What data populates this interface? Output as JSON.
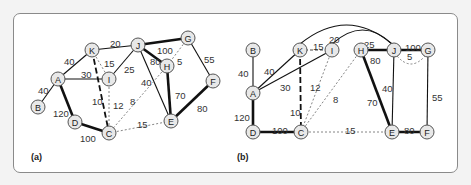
{
  "panels": {
    "a": {
      "label": "(a)",
      "nodes": [
        {
          "id": "K",
          "x": 92,
          "y": 50
        },
        {
          "id": "J",
          "x": 138,
          "y": 45
        },
        {
          "id": "G",
          "x": 188,
          "y": 38
        },
        {
          "id": "A",
          "x": 58,
          "y": 79
        },
        {
          "id": "I",
          "x": 109,
          "y": 79
        },
        {
          "id": "H",
          "x": 167,
          "y": 66
        },
        {
          "id": "F",
          "x": 213,
          "y": 81
        },
        {
          "id": "B",
          "x": 38,
          "y": 107
        },
        {
          "id": "D",
          "x": 75,
          "y": 122
        },
        {
          "id": "C",
          "x": 109,
          "y": 133
        },
        {
          "id": "E",
          "x": 171,
          "y": 121
        }
      ],
      "edges": [
        {
          "from": "A",
          "to": "B",
          "weight": "40",
          "style": "solid",
          "lx": 38,
          "ly": 91
        },
        {
          "from": "A",
          "to": "K",
          "weight": "40",
          "style": "solid",
          "lx": 64,
          "ly": 62
        },
        {
          "from": "A",
          "to": "I",
          "weight": "30",
          "style": "solid",
          "lx": 81,
          "ly": 75
        },
        {
          "from": "A",
          "to": "D",
          "weight": "120",
          "style": "bold",
          "lx": 53,
          "ly": 114
        },
        {
          "from": "K",
          "to": "J",
          "weight": "20",
          "style": "solid",
          "lx": 110,
          "ly": 44
        },
        {
          "from": "K",
          "to": "I",
          "weight": "15",
          "style": "dotted",
          "lx": 104,
          "ly": 64
        },
        {
          "from": "K",
          "to": "C",
          "weight": "10",
          "style": "dashed-bold",
          "lx": 92,
          "ly": 102
        },
        {
          "from": "I",
          "to": "J",
          "weight": "25",
          "style": "solid",
          "lx": 124,
          "ly": 70
        },
        {
          "from": "I",
          "to": "C",
          "weight": "12",
          "style": "dotted",
          "lx": 113,
          "ly": 106
        },
        {
          "from": "J",
          "to": "G",
          "weight": "100",
          "style": "bold",
          "lx": 157,
          "ly": 51
        },
        {
          "from": "J",
          "to": "H",
          "weight": "80",
          "style": "bold",
          "lx": 150,
          "ly": 62
        },
        {
          "from": "J",
          "to": "E",
          "weight": "40",
          "style": "solid",
          "lx": 141,
          "ly": 83
        },
        {
          "from": "G",
          "to": "H",
          "weight": "5",
          "style": "dotted",
          "lx": 177,
          "ly": 62
        },
        {
          "from": "G",
          "to": "F",
          "weight": "55",
          "style": "solid",
          "lx": 204,
          "ly": 60
        },
        {
          "from": "H",
          "to": "E",
          "weight": "70",
          "style": "bold",
          "lx": 175,
          "ly": 96
        },
        {
          "from": "H",
          "to": "C",
          "weight": "8",
          "style": "dotted",
          "lx": 130,
          "ly": 102
        },
        {
          "from": "F",
          "to": "E",
          "weight": "80",
          "style": "bold",
          "lx": 197,
          "ly": 109
        },
        {
          "from": "D",
          "to": "C",
          "weight": "100",
          "style": "bold",
          "lx": 80,
          "ly": 139
        },
        {
          "from": "C",
          "to": "E",
          "weight": "15",
          "style": "dotted",
          "lx": 137,
          "ly": 125
        }
      ]
    },
    "b": {
      "label": "(b)",
      "nodes": [
        {
          "id": "B",
          "x": 253,
          "y": 50
        },
        {
          "id": "K",
          "x": 300,
          "y": 50
        },
        {
          "id": "I",
          "x": 332,
          "y": 50
        },
        {
          "id": "H",
          "x": 361,
          "y": 50
        },
        {
          "id": "J",
          "x": 394,
          "y": 50
        },
        {
          "id": "G",
          "x": 428,
          "y": 50
        },
        {
          "id": "A",
          "x": 253,
          "y": 93
        },
        {
          "id": "D",
          "x": 253,
          "y": 132
        },
        {
          "id": "C",
          "x": 301,
          "y": 132
        },
        {
          "id": "E",
          "x": 392,
          "y": 132
        },
        {
          "id": "F",
          "x": 427,
          "y": 132
        }
      ],
      "edges": [
        {
          "from": "B",
          "to": "A",
          "weight": "40",
          "style": "solid",
          "lx": 238,
          "ly": 74
        },
        {
          "from": "A",
          "to": "K",
          "weight": "40",
          "style": "solid",
          "lx": 264,
          "ly": 72
        },
        {
          "from": "A",
          "to": "I",
          "weight": "30",
          "style": "solid",
          "lx": 280,
          "ly": 88
        },
        {
          "from": "A",
          "to": "D",
          "weight": "120",
          "style": "bold",
          "lx": 234,
          "ly": 118
        },
        {
          "from": "K",
          "to": "I",
          "weight": "15",
          "style": "dashed",
          "lx": 313,
          "ly": 47
        },
        {
          "from": "K",
          "to": "J",
          "weight": "20",
          "style": "curve",
          "lx": 329,
          "ly": 40
        },
        {
          "from": "I",
          "to": "J",
          "weight": "25",
          "style": "curve",
          "lx": 364,
          "ly": 45
        },
        {
          "from": "K",
          "to": "C",
          "weight": "10",
          "style": "dashed-bold",
          "lx": 290,
          "ly": 113
        },
        {
          "from": "I",
          "to": "C",
          "weight": "12",
          "style": "dotted",
          "lx": 310,
          "ly": 88
        },
        {
          "from": "H",
          "to": "C",
          "weight": "8",
          "style": "dotted",
          "lx": 333,
          "ly": 100
        },
        {
          "from": "H",
          "to": "J",
          "weight": "80",
          "style": "bold",
          "lx": 370,
          "ly": 61
        },
        {
          "from": "J",
          "to": "G",
          "weight": "100",
          "style": "bold",
          "lx": 405,
          "ly": 48
        },
        {
          "from": "J",
          "to": "G",
          "weight": "5",
          "style": "dotted-curve",
          "lx": 407,
          "ly": 57
        },
        {
          "from": "J",
          "to": "E",
          "weight": "40",
          "style": "solid",
          "lx": 382,
          "ly": 89
        },
        {
          "from": "G",
          "to": "F",
          "weight": "55",
          "style": "solid",
          "lx": 432,
          "ly": 98
        },
        {
          "from": "H",
          "to": "E",
          "weight": "70",
          "style": "bold",
          "lx": 367,
          "ly": 103
        },
        {
          "from": "D",
          "to": "C",
          "weight": "100",
          "style": "bold",
          "lx": 272,
          "ly": 131
        },
        {
          "from": "C",
          "to": "E",
          "weight": "15",
          "style": "dotted",
          "lx": 345,
          "ly": 131
        },
        {
          "from": "E",
          "to": "F",
          "weight": "80",
          "style": "bold",
          "lx": 404,
          "ly": 131
        }
      ]
    }
  },
  "colors": {
    "edge": "#111111",
    "dotted": "#666666",
    "node_fill": "#e8e8e8",
    "node_stroke": "#555555",
    "frame": "#8a8a8a",
    "background": "#f3f3f3"
  }
}
